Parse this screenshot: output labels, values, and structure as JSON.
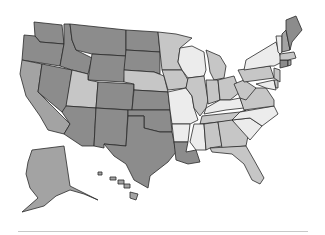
{
  "map": {
    "type": "choropleth",
    "region": "United States",
    "palette": {
      "darkest": "#8c8c8c",
      "dark": "#a3a3a3",
      "light": "#c6c6c6",
      "lightest": "#ececec",
      "stroke": "#2a2a2a"
    },
    "states": [
      {
        "id": "WA",
        "shade": "darkest",
        "d": "M34,22 L62,25 L64,44 L40,42 L35,36 Z"
      },
      {
        "id": "OR",
        "shade": "darkest",
        "d": "M24,35 L35,36 L40,42 L64,44 L60,66 L22,60 Z"
      },
      {
        "id": "CA",
        "shade": "dark",
        "d": "M22,60 L42,64 L38,92 L70,124 L64,134 L48,130 L40,116 L26,96 L20,74 Z"
      },
      {
        "id": "NV",
        "shade": "darkest",
        "d": "M42,64 L72,70 L66,110 L62,112 L38,92 Z"
      },
      {
        "id": "ID",
        "shade": "darkest",
        "d": "M64,24 L70,24 L72,40 L76,50 L92,58 L88,74 L72,70 L60,66 L64,44 Z"
      },
      {
        "id": "MT",
        "shade": "darkest",
        "d": "M70,24 L126,30 L126,56 L92,54 L76,50 L72,40 Z"
      },
      {
        "id": "WY",
        "shade": "darkest",
        "d": "M92,54 L126,56 L124,82 L88,80 Z"
      },
      {
        "id": "UT",
        "shade": "light",
        "d": "M72,70 L88,74 L88,80 L98,82 L96,108 L66,106 Z"
      },
      {
        "id": "AZ",
        "shade": "darkest",
        "d": "M66,106 L96,108 L94,146 L82,146 L64,134 L70,124 L62,112 Z"
      },
      {
        "id": "CO",
        "shade": "darkest",
        "d": "M98,82 L134,84 L132,110 L96,108 Z"
      },
      {
        "id": "NM",
        "shade": "darkest",
        "d": "M96,108 L128,110 L126,146 L104,144 L104,148 L94,146 Z"
      },
      {
        "id": "ND",
        "shade": "darkest",
        "d": "M126,30 L158,32 L160,52 L126,50 Z"
      },
      {
        "id": "SD",
        "shade": "darkest",
        "d": "M126,50 L160,52 L160,74 L154,72 L124,70 Z"
      },
      {
        "id": "NE",
        "shade": "light",
        "d": "M124,70 L154,72 L164,76 L168,92 L134,90 L134,84 L124,82 Z"
      },
      {
        "id": "KS",
        "shade": "darkest",
        "d": "M134,90 L168,92 L170,110 L132,110 Z"
      },
      {
        "id": "OK",
        "shade": "darkest",
        "d": "M128,110 L170,110 L172,132 L160,132 L144,128 L144,116 L128,116 Z"
      },
      {
        "id": "TX",
        "shade": "darkest",
        "d": "M104,144 L126,146 L128,116 L144,116 L144,128 L160,132 L172,132 L176,152 L168,162 L150,176 L148,188 L134,180 L126,164 L114,156 Z"
      },
      {
        "id": "MN",
        "shade": "light",
        "d": "M158,32 L176,34 L192,38 L180,48 L178,62 L182,70 L162,70 L160,52 Z"
      },
      {
        "id": "IA",
        "shade": "light",
        "d": "M162,70 L182,70 L188,80 L186,88 L168,90 L164,76 Z"
      },
      {
        "id": "MO",
        "shade": "lightest",
        "d": "M168,92 L186,88 L192,96 L194,108 L198,120 L190,124 L172,124 L170,110 Z"
      },
      {
        "id": "AR",
        "shade": "lightest",
        "d": "M172,124 L190,124 L188,142 L174,142 Z"
      },
      {
        "id": "LA",
        "shade": "darkest",
        "d": "M174,142 L188,142 L186,152 L196,150 L200,162 L188,164 L176,160 Z"
      },
      {
        "id": "WI",
        "shade": "lightest",
        "d": "M180,48 L192,46 L204,52 L206,70 L204,76 L188,78 L182,70 L178,62 Z"
      },
      {
        "id": "IL",
        "shade": "light",
        "d": "M188,78 L204,76 L208,100 L206,108 L200,116 L194,108 L192,96 L186,88 Z"
      },
      {
        "id": "MI",
        "shade": "light",
        "d": "M206,50 L220,56 L226,66 L224,78 L214,80 L210,72 L208,58 Z"
      },
      {
        "id": "IN",
        "shade": "light",
        "d": "M206,80 L218,80 L220,100 L208,104 Z"
      },
      {
        "id": "OH",
        "shade": "light",
        "d": "M218,80 L234,76 L240,92 L230,100 L220,100 Z"
      },
      {
        "id": "KY",
        "shade": "lightest",
        "d": "M206,108 L220,100 L230,100 L240,98 L244,108 L226,110 L204,114 Z"
      },
      {
        "id": "TN",
        "shade": "light",
        "d": "M202,116 L240,112 L246,110 L238,120 L200,124 Z"
      },
      {
        "id": "MS",
        "shade": "lightest",
        "d": "M194,124 L204,124 L206,150 L196,150 L190,142 Z"
      },
      {
        "id": "AL",
        "shade": "light",
        "d": "M204,124 L218,122 L222,146 L210,148 L206,150 Z"
      },
      {
        "id": "GA",
        "shade": "light",
        "d": "M218,122 L232,120 L248,136 L246,146 L222,148 Z"
      },
      {
        "id": "FL",
        "shade": "light",
        "d": "M210,148 L246,146 L254,160 L264,178 L260,184 L252,180 L244,164 L232,154 L212,152 Z"
      },
      {
        "id": "SC",
        "shade": "lightest",
        "d": "M232,120 L250,118 L262,126 L250,140 Z"
      },
      {
        "id": "NC",
        "shade": "lightest",
        "d": "M240,112 L274,106 L278,114 L262,126 L250,118 L232,120 Z"
      },
      {
        "id": "VA",
        "shade": "light",
        "d": "M240,98 L256,88 L266,88 L274,100 L274,106 L244,110 Z"
      },
      {
        "id": "WV",
        "shade": "light",
        "d": "M234,84 L244,80 L256,88 L246,100 L240,98 Z"
      },
      {
        "id": "PA",
        "shade": "light",
        "d": "M238,70 L270,66 L274,78 L244,82 Z"
      },
      {
        "id": "NY",
        "shade": "lightest",
        "d": "M246,60 L266,48 L276,42 L282,62 L274,66 L270,66 L244,70 Z"
      },
      {
        "id": "MD",
        "shade": "lightest",
        "d": "M256,84 L274,80 L276,90 L266,88 Z"
      },
      {
        "id": "DE",
        "shade": "light",
        "d": "M274,80 L278,80 L278,88 L276,88 Z"
      },
      {
        "id": "NJ",
        "shade": "light",
        "d": "M274,68 L280,70 L280,82 L274,78 Z"
      },
      {
        "id": "CT",
        "shade": "darkest",
        "d": "M280,60 L288,60 L288,66 L280,68 Z"
      },
      {
        "id": "RI",
        "shade": "dark",
        "d": "M288,60 L291,60 L291,65 L288,66 Z"
      },
      {
        "id": "MA",
        "shade": "light",
        "d": "M280,54 L294,52 L296,58 L288,60 L280,60 Z"
      },
      {
        "id": "VT",
        "shade": "lightest",
        "d": "M276,36 L282,36 L282,52 L280,54 L278,52 Z"
      },
      {
        "id": "NH",
        "shade": "dark",
        "d": "M282,34 L286,30 L290,50 L282,52 Z"
      },
      {
        "id": "ME",
        "shade": "darkest",
        "d": "M286,20 L296,16 L302,30 L292,42 L290,50 L286,30 Z"
      },
      {
        "id": "AK",
        "shade": "dark",
        "d": "M32,150 L64,146 L70,186 L98,200 L84,194 L70,190 L56,196 L44,206 L22,212 L38,198 L30,188 L26,174 L28,162 Z"
      },
      {
        "id": "HI-1",
        "shade": "dark",
        "d": "M98,172 L102,172 L102,175 L98,175 Z"
      },
      {
        "id": "HI-2",
        "shade": "dark",
        "d": "M110,177 L116,177 L116,180 L110,180 Z"
      },
      {
        "id": "HI-3",
        "shade": "dark",
        "d": "M118,180 L124,180 L124,184 L118,184 Z"
      },
      {
        "id": "HI-4",
        "shade": "dark",
        "d": "M124,184 L130,184 L130,188 L124,188 Z"
      },
      {
        "id": "HI-5",
        "shade": "dark",
        "d": "M130,192 L138,194 L136,200 L130,198 Z"
      }
    ]
  }
}
